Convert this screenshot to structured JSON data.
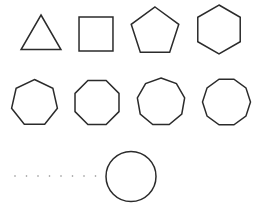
{
  "diagram": {
    "title": "",
    "background": "#ffffff",
    "stroke_color": "#2b2b2b",
    "stroke_width": 1.5,
    "dot_color": "#8a8a8a",
    "shapes": [
      {
        "name": "triangle",
        "sides": 3,
        "cx": 41,
        "cy": 38,
        "r": 23,
        "rotation_deg": -90
      },
      {
        "name": "square",
        "sides": 4,
        "cx": 96,
        "cy": 34,
        "r": 24,
        "rotation_deg": 45
      },
      {
        "name": "pentagon",
        "sides": 5,
        "cx": 155,
        "cy": 32,
        "r": 25,
        "rotation_deg": -90
      },
      {
        "name": "hexagon",
        "sides": 6,
        "cx": 219,
        "cy": 29.5,
        "r": 24.5,
        "rotation_deg": -90
      },
      {
        "name": "heptagon",
        "sides": 7,
        "cx": 34.5,
        "cy": 103,
        "r": 23.5,
        "rotation_deg": -90
      },
      {
        "name": "octagon",
        "sides": 8,
        "cx": 97,
        "cy": 102.5,
        "r": 23.8,
        "rotation_deg": 22.5
      },
      {
        "name": "nonagon",
        "sides": 9,
        "cx": 161,
        "cy": 102,
        "r": 24,
        "rotation_deg": -90
      },
      {
        "name": "decagon",
        "sides": 10,
        "cx": 226.5,
        "cy": 102,
        "r": 24,
        "rotation_deg": 0
      }
    ],
    "ellipsis_dots": {
      "count": 8,
      "x_start": 15,
      "spacing": 11.5,
      "y": 176,
      "r": 0.8
    },
    "circle": {
      "name": "circle",
      "cx": 131,
      "cy": 176.5,
      "r": 25
    }
  }
}
